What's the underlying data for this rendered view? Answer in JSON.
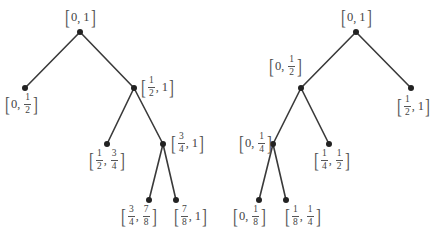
{
  "diagram": {
    "colors": {
      "edge": "#3a3a3a",
      "node": "#222222",
      "text": "#444444"
    },
    "trees": [
      {
        "name": "left-tree",
        "nodes": [
          {
            "id": "L0",
            "x": 80,
            "y": 32,
            "label": "[0, 1]",
            "parts": [
              "[",
              "0",
              ",",
              "1",
              "]"
            ],
            "lx": 64,
            "ly": 7
          },
          {
            "id": "L1",
            "x": 25,
            "y": 88,
            "label": "[0, 1/2]",
            "parts": [
              "[",
              "0",
              ",",
              "1/2",
              "]"
            ],
            "lx": 4,
            "ly": 93
          },
          {
            "id": "L2",
            "x": 134,
            "y": 88,
            "label": "[1/2, 1]",
            "parts": [
              "[",
              "1/2",
              ",",
              "1",
              "]"
            ],
            "lx": 140,
            "ly": 76
          },
          {
            "id": "L3",
            "x": 107,
            "y": 144,
            "label": "[1/2, 3/4]",
            "parts": [
              "[",
              "1/2",
              ",",
              "3/4",
              "]"
            ],
            "lx": 88,
            "ly": 149
          },
          {
            "id": "L4",
            "x": 163,
            "y": 144,
            "label": "[3/4, 1]",
            "parts": [
              "[",
              "3/4",
              ",",
              "1",
              "]"
            ],
            "lx": 170,
            "ly": 132
          },
          {
            "id": "L5",
            "x": 149,
            "y": 200,
            "label": "[3/4, 7/8]",
            "parts": [
              "[",
              "3/4",
              ",",
              "7/8",
              "]"
            ],
            "lx": 120,
            "ly": 205
          },
          {
            "id": "L6",
            "x": 176,
            "y": 200,
            "label": "[7/8, 1]",
            "parts": [
              "[",
              "7/8",
              ",",
              "1",
              "]"
            ],
            "lx": 173,
            "ly": 205
          }
        ],
        "edges": [
          [
            "L0",
            "L1"
          ],
          [
            "L0",
            "L2"
          ],
          [
            "L2",
            "L3"
          ],
          [
            "L2",
            "L4"
          ],
          [
            "L4",
            "L5"
          ],
          [
            "L4",
            "L6"
          ]
        ]
      },
      {
        "name": "right-tree",
        "nodes": [
          {
            "id": "R0",
            "x": 356,
            "y": 32,
            "label": "[0, 1]",
            "parts": [
              "[",
              "0",
              ",",
              "1",
              "]"
            ],
            "lx": 340,
            "ly": 7
          },
          {
            "id": "R1",
            "x": 301,
            "y": 88,
            "label": "[0, 1/2]",
            "parts": [
              "[",
              "0",
              ",",
              "1/2",
              "]"
            ],
            "lx": 268,
            "ly": 55
          },
          {
            "id": "R2",
            "x": 411,
            "y": 88,
            "label": "[1/2, 1]",
            "parts": [
              "[",
              "1/2",
              ",",
              "1",
              "]"
            ],
            "lx": 396,
            "ly": 95
          },
          {
            "id": "R3",
            "x": 273,
            "y": 144,
            "label": "[0, 1/4]",
            "parts": [
              "[",
              "0",
              ",",
              "1/4",
              "]"
            ],
            "lx": 238,
            "ly": 132
          },
          {
            "id": "R4",
            "x": 329,
            "y": 144,
            "label": "[1/4, 1/2]",
            "parts": [
              "[",
              "1/4",
              ",",
              "1/2",
              "]"
            ],
            "lx": 313,
            "ly": 149
          },
          {
            "id": "R5",
            "x": 259,
            "y": 200,
            "label": "[0, 1/8]",
            "parts": [
              "[",
              "0",
              ",",
              "1/8",
              "]"
            ],
            "lx": 232,
            "ly": 205
          },
          {
            "id": "R6",
            "x": 286,
            "y": 200,
            "label": "[1/8, 1/4]",
            "parts": [
              "[",
              "1/8",
              ",",
              "1/4",
              "]"
            ],
            "lx": 284,
            "ly": 205
          }
        ],
        "edges": [
          [
            "R0",
            "R1"
          ],
          [
            "R0",
            "R2"
          ],
          [
            "R1",
            "R3"
          ],
          [
            "R1",
            "R4"
          ],
          [
            "R3",
            "R5"
          ],
          [
            "R3",
            "R6"
          ]
        ]
      }
    ]
  }
}
